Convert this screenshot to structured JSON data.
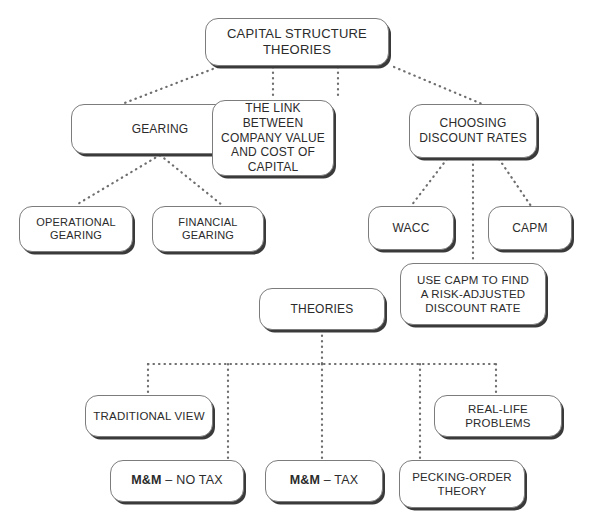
{
  "diagram": {
    "title": "CAPITAL STRUCTURE THEORIES",
    "style": {
      "background": "#ffffff",
      "box_border": "#7c7c7c",
      "box_shadow": "#3a3a3a",
      "text_color": "#2b2b2b",
      "connector_color": "#6e6e6e",
      "connector_style": "dotted"
    },
    "nodes": {
      "root": "CAPITAL STRUCTURE THEORIES",
      "gearing": "GEARING",
      "link_company_value": "THE LINK BETWEEN\nCOMPANY VALUE\nAND COST OF\nCAPITAL",
      "choosing_discount_rates": "CHOOSING\nDISCOUNT RATES",
      "operational_gearing": "OPERATIONAL\nGEARING",
      "financial_gearing": "FINANCIAL\nGEARING",
      "wacc": "WACC",
      "capm": "CAPM",
      "use_capm": "USE CAPM TO FIND\nA RISK-ADJUSTED\nDISCOUNT RATE",
      "theories": "THEORIES",
      "traditional_view": "TRADITIONAL VIEW",
      "real_life_problems": "REAL-LIFE PROBLEMS",
      "mm_no_tax_strong": "M&M",
      "mm_no_tax_rest": " – NO TAX",
      "mm_tax_strong": "M&M",
      "mm_tax_rest": " – TAX",
      "pecking_order": "PECKING-ORDER\nTHEORY"
    }
  }
}
